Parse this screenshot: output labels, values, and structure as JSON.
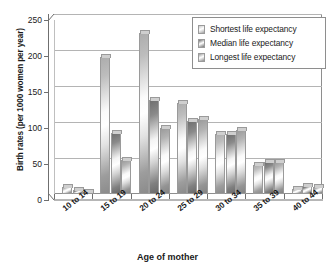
{
  "chart_data": {
    "type": "bar",
    "title": "",
    "xlabel": "Age of mother",
    "ylabel": "Birth rates (per 1000 women per year)",
    "categories": [
      "10 to 14",
      "15 to 19",
      "20 to 24",
      "25 to 29",
      "30 to 34",
      "35 to 39",
      "40 to 44"
    ],
    "series": [
      {
        "name": "Shortest life expectancy",
        "values": [
          10,
          190,
          223,
          127,
          83,
          40,
          7
        ]
      },
      {
        "name": "Median life expectancy",
        "values": [
          5,
          85,
          130,
          102,
          84,
          45,
          11
        ]
      },
      {
        "name": "Longest life expectancy",
        "values": [
          1,
          47,
          92,
          104,
          89,
          44,
          10
        ]
      }
    ],
    "ylim": [
      0,
      250
    ],
    "yticks": [
      0,
      50,
      100,
      150,
      200,
      250
    ],
    "ytick_labels": [
      "0",
      "50",
      "100",
      "150",
      "200",
      "250"
    ],
    "grid": true,
    "legend_position": "top-right"
  },
  "legend": {
    "entries": [
      {
        "label": "Shortest life expectancy"
      },
      {
        "label": "Median life expectancy"
      },
      {
        "label": "Longest life expectancy"
      }
    ]
  },
  "colors": {
    "axis": "#6f6f6f",
    "grid": "#b4b4b4",
    "frame": "#8e8e8e",
    "text": "#1a1a1a",
    "background": "#ffffff"
  }
}
